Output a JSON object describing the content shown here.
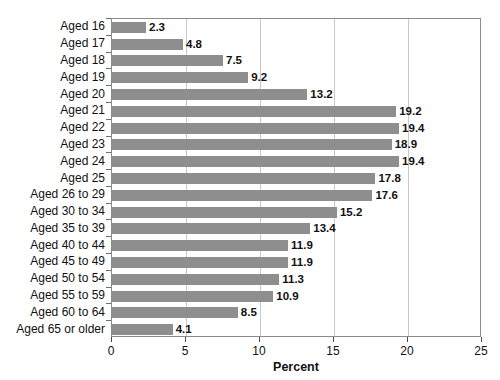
{
  "chart_data": {
    "type": "bar",
    "orientation": "horizontal",
    "title": "",
    "xlabel": "Percent",
    "ylabel": "",
    "xlim": [
      0,
      25
    ],
    "xticks": [
      0,
      5,
      10,
      15,
      20,
      25
    ],
    "xtick_labels": [
      "0",
      "5",
      "10",
      "15",
      "20",
      "25"
    ],
    "grid": true,
    "grid_axis": "x",
    "legend": false,
    "bar_color": "#8e8e8e",
    "value_labels": true,
    "categories": [
      "Aged 16",
      "Aged 17",
      "Aged 18",
      "Aged 19",
      "Aged 20",
      "Aged 21",
      "Aged 22",
      "Aged 23",
      "Aged 24",
      "Aged 25",
      "Aged 26 to 29",
      "Aged 30 to 34",
      "Aged 35 to 39",
      "Aged 40 to 44",
      "Aged 45 to 49",
      "Aged 50 to 54",
      "Aged 55 to 59",
      "Aged 60 to 64",
      "Aged 65 or older"
    ],
    "values": [
      2.3,
      4.8,
      7.5,
      9.2,
      13.2,
      19.2,
      19.4,
      18.9,
      19.4,
      17.8,
      17.6,
      15.2,
      13.4,
      11.9,
      11.9,
      11.3,
      10.9,
      8.5,
      4.1
    ],
    "value_text": [
      "2.3",
      "4.8",
      "7.5",
      "9.2",
      "13.2",
      "19.2",
      "19.4",
      "18.9",
      "19.4",
      "17.8",
      "17.6",
      "15.2",
      "13.4",
      "11.9",
      "11.9",
      "11.3",
      "10.9",
      "8.5",
      "4.1"
    ]
  }
}
